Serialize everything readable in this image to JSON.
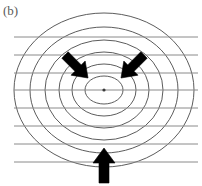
{
  "figure": {
    "panel_label": "(b)",
    "caption_color": "#5b5b5b",
    "background_color": "#ffffff",
    "width": 202,
    "height": 186
  },
  "chart_data": {
    "type": "contour_schematic",
    "title": "(b)",
    "xlabel": "",
    "ylabel": "",
    "grid": true,
    "legend": false,
    "center": {
      "x": 104,
      "y": 90,
      "dot_radius": 1.6,
      "dot_color": "#3a3a3a"
    },
    "contour_color": "#4a4a4a",
    "contour_stroke_width": 0.9,
    "contours": [
      {
        "index": 1,
        "rx": 19,
        "ry": 14
      },
      {
        "index": 2,
        "rx": 32,
        "ry": 26
      },
      {
        "index": 3,
        "rx": 45,
        "ry": 38
      },
      {
        "index": 4,
        "rx": 59,
        "ry": 50
      },
      {
        "index": 5,
        "rx": 74,
        "ry": 63
      },
      {
        "index": 6,
        "rx": 90,
        "ry": 77
      }
    ],
    "horizontal_lines": {
      "color": "#8a8a8a",
      "stroke_width": 1.0,
      "x_start": 14,
      "x_end": 198,
      "y_values": [
        37,
        55,
        73,
        90,
        108,
        126,
        144,
        162
      ]
    },
    "arrows": [
      {
        "name": "upper-left-arrow",
        "direction": "southeast",
        "angle_deg": 45,
        "tail": {
          "x": 65,
          "y": 55
        },
        "head": {
          "x": 88,
          "y": 78
        },
        "color": "#000000",
        "shaft_width": 9,
        "head_width": 20,
        "head_length": 14
      },
      {
        "name": "upper-right-arrow",
        "direction": "southwest",
        "angle_deg": 135,
        "tail": {
          "x": 144,
          "y": 55
        },
        "head": {
          "x": 121,
          "y": 78
        },
        "color": "#000000",
        "shaft_width": 9,
        "head_width": 20,
        "head_length": 14
      },
      {
        "name": "bottom-arrow",
        "direction": "north",
        "angle_deg": 270,
        "tail": {
          "x": 104,
          "y": 183
        },
        "head": {
          "x": 104,
          "y": 148
        },
        "color": "#000000",
        "shaft_width": 10,
        "head_width": 22,
        "head_length": 15
      }
    ]
  }
}
